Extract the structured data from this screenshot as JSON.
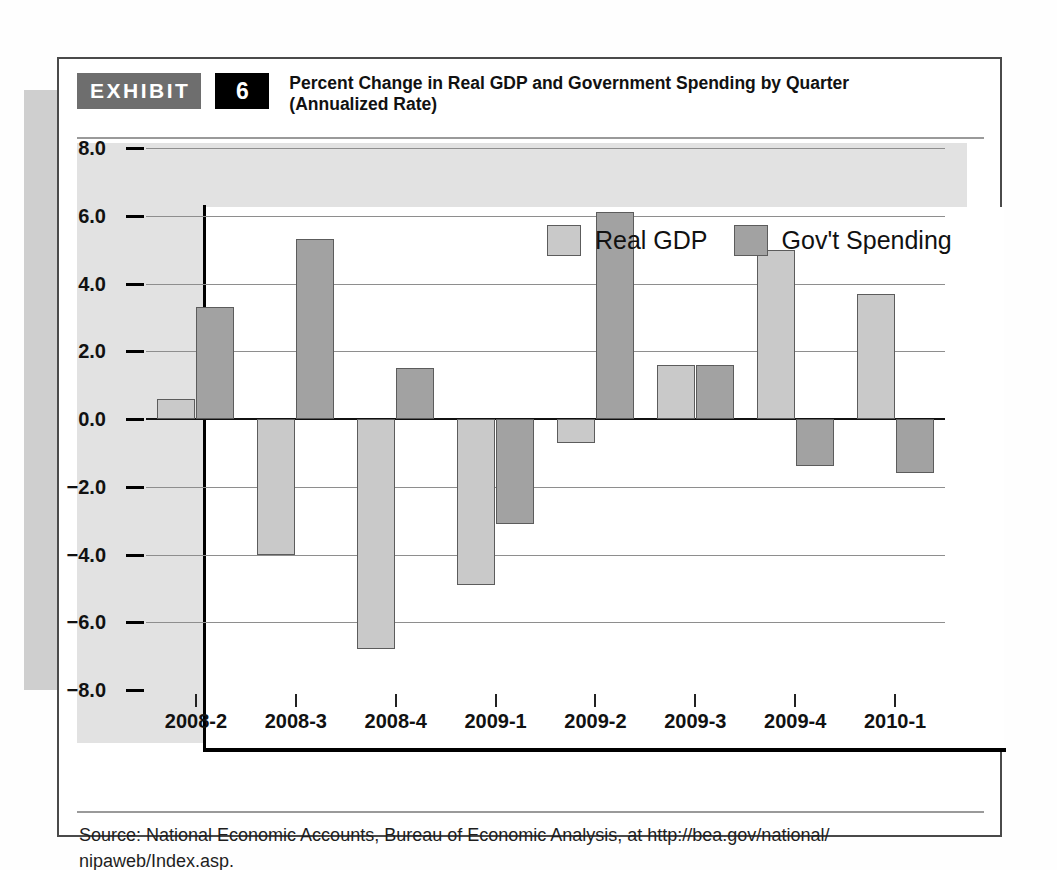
{
  "exhibit": {
    "tag_label": "EXHIBIT",
    "number": "6",
    "title_line1": "Percent Change in Real GDP and Government Spending by Quarter",
    "title_line2": "(Annualized Rate)"
  },
  "source": {
    "text": "Source: National Economic Accounts, Bureau of Economic Analysis, at http://bea.gov/national/ nipaweb/Index.asp."
  },
  "legend": {
    "items": [
      {
        "label": "Real GDP",
        "color": "#c9c9c9"
      },
      {
        "label": "Gov't Spending",
        "color": "#a2a2a2"
      }
    ]
  },
  "chart_data": {
    "type": "bar",
    "title": "Percent Change in Real GDP and Government Spending by Quarter (Annualized Rate)",
    "xlabel": "",
    "ylabel": "",
    "ylim": [
      -8.0,
      8.0
    ],
    "ytick_labels": [
      "8.0",
      "6.0",
      "4.0",
      "2.0",
      "0.0",
      "-2.0",
      "-4.0",
      "-6.0",
      "-8.0"
    ],
    "ytick_values": [
      8.0,
      6.0,
      4.0,
      2.0,
      0.0,
      -2.0,
      -4.0,
      -6.0,
      -8.0
    ],
    "grid": true,
    "legend_position": "top-center",
    "categories": [
      "2008-2",
      "2008-3",
      "2008-4",
      "2009-1",
      "2009-2",
      "2009-3",
      "2009-4",
      "2010-1"
    ],
    "series": [
      {
        "name": "Real GDP",
        "color": "#c9c9c9",
        "values": [
          0.6,
          -4.0,
          -6.8,
          -4.9,
          -0.7,
          1.6,
          5.0,
          3.7
        ]
      },
      {
        "name": "Gov't Spending",
        "color": "#a2a2a2",
        "values": [
          3.3,
          5.3,
          1.5,
          -3.1,
          6.1,
          1.6,
          -1.4,
          -1.6
        ]
      }
    ]
  }
}
